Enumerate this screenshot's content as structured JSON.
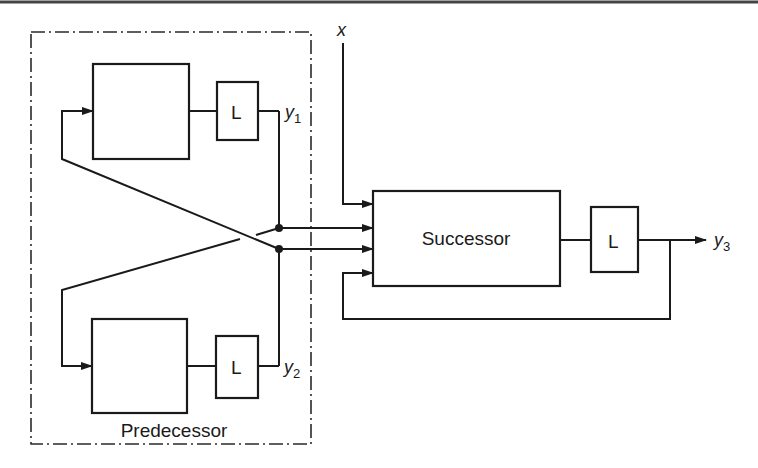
{
  "diagram": {
    "predecessor": {
      "label": "Predecessor",
      "upper_block": {
        "label": ""
      },
      "upper_delay": {
        "label": "L"
      },
      "lower_block": {
        "label": ""
      },
      "lower_delay": {
        "label": "L"
      },
      "output_upper": {
        "base": "y",
        "sub": "1"
      },
      "output_lower": {
        "base": "y",
        "sub": "2"
      }
    },
    "successor": {
      "label": "Successor",
      "delay": {
        "label": "L"
      },
      "output": {
        "base": "y",
        "sub": "3"
      }
    },
    "external_input": {
      "label": "x"
    }
  }
}
